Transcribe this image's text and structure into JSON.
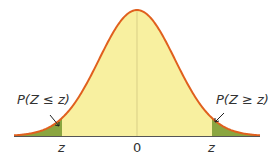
{
  "diagram": {
    "type": "normal-distribution",
    "colors": {
      "curve": "#e0601e",
      "fill": "#f8f0a0",
      "tail": "#8aa540",
      "axis": "#555555",
      "center_line": "#d9cf86"
    },
    "labels": {
      "left_tail": "P(Z ≤ z)",
      "right_tail": "P(Z ≥ z)",
      "left_tick": "z",
      "center_tick": "0",
      "right_tick": "z"
    }
  }
}
